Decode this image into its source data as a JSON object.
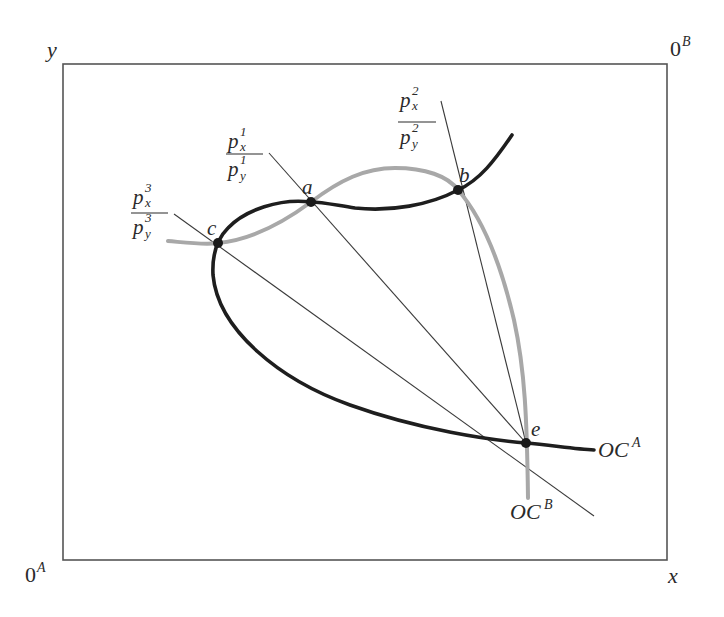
{
  "diagram": {
    "type": "edgeworth-box-offer-curves",
    "colors": {
      "frame": "#555555",
      "offer_curve_A": "#1e1e1e",
      "offer_curve_B": "#a8a8a8",
      "price_line": "#3a3a3a",
      "point": "#1a1a1a",
      "text": "#2a2a2a"
    },
    "axes": {
      "y_label": "y",
      "x_label": "x",
      "origin_A": {
        "base": "0",
        "sup": "A"
      },
      "origin_B": {
        "base": "0",
        "sup": "B"
      }
    },
    "curves": {
      "oc_a": {
        "base": "OC",
        "sup": "A"
      },
      "oc_b": {
        "base": "OC",
        "sup": "B"
      }
    },
    "points": [
      {
        "id": "a",
        "label": "a"
      },
      {
        "id": "b",
        "label": "b"
      },
      {
        "id": "c",
        "label": "c"
      },
      {
        "id": "e",
        "label": "e"
      }
    ],
    "price_ratios": [
      {
        "id": "p1",
        "num_base": "p",
        "num_sub": "x",
        "num_sup": "1",
        "den_base": "p",
        "den_sub": "y",
        "den_sup": "1"
      },
      {
        "id": "p2",
        "num_base": "p",
        "num_sub": "x",
        "num_sup": "2",
        "den_base": "p",
        "den_sub": "y",
        "den_sup": "2"
      },
      {
        "id": "p3",
        "num_base": "p",
        "num_sub": "x",
        "num_sup": "3",
        "den_base": "p",
        "den_sub": "y",
        "den_sup": "3"
      }
    ]
  }
}
